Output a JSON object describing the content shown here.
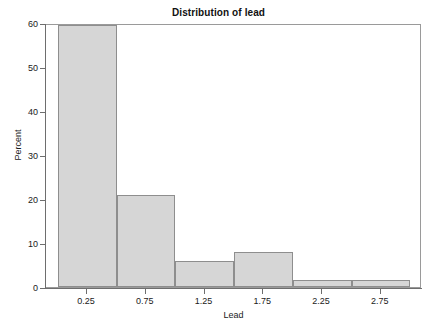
{
  "chart_data": {
    "type": "bar",
    "title": "Distribution of lead",
    "xlabel": "Lead",
    "ylabel": "Percent",
    "categories": [
      "0.25",
      "0.75",
      "1.25",
      "1.75",
      "2.25",
      "2.75"
    ],
    "bin_edges": [
      0.0,
      0.5,
      1.0,
      1.5,
      2.0,
      2.5,
      3.0
    ],
    "values": [
      59.5,
      21.0,
      6.0,
      8.0,
      1.5,
      1.5
    ],
    "bars": [
      {
        "label": "0.25",
        "bin_start": 0.0,
        "bin_end": 0.5,
        "value": 59.5
      },
      {
        "label": "0.75",
        "bin_start": 0.5,
        "bin_end": 1.0,
        "value": 21.0
      },
      {
        "label": "1.25",
        "bin_start": 1.0,
        "bin_end": 1.5,
        "value": 6.0
      },
      {
        "label": "1.75",
        "bin_start": 1.5,
        "bin_end": 2.0,
        "value": 8.0
      },
      {
        "label": "2.25",
        "bin_start": 2.0,
        "bin_end": 2.5,
        "value": 1.5
      },
      {
        "label": "2.75",
        "bin_start": 2.5,
        "bin_end": 3.0,
        "value": 1.5
      }
    ],
    "ylim": [
      0,
      60
    ],
    "xlim": [
      -0.1,
      3.1
    ],
    "y_ticks": [
      0,
      10,
      20,
      30,
      40,
      50,
      60
    ],
    "y_tick_labels": [
      "0",
      "10",
      "20",
      "30",
      "40",
      "50",
      "60"
    ],
    "x_ticks": [
      0.25,
      0.75,
      1.25,
      1.75,
      2.25,
      2.75
    ],
    "x_tick_labels": [
      "0.25",
      "0.75",
      "1.25",
      "1.75",
      "2.25",
      "2.75"
    ],
    "grid": false,
    "legend": false,
    "colors": {
      "bar_fill": "#d6d6d6",
      "bar_border": "#8e8e8e",
      "axis": "#6e6e6e",
      "frame": "#9a9a9a",
      "text": "#1a1a1a",
      "background": "#ffffff"
    }
  }
}
